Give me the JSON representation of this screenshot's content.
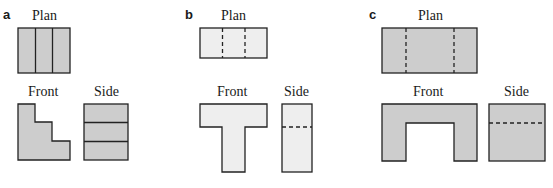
{
  "panels": [
    {
      "label": "a",
      "plan": "Plan",
      "front": "Front",
      "side": "Side",
      "fill": "#cdcdcd"
    },
    {
      "label": "b",
      "plan": "Plan",
      "front": "Front",
      "side": "Side",
      "fill": "#eeeeee"
    },
    {
      "label": "c",
      "plan": "Plan",
      "front": "Front",
      "side": "Side",
      "fill": "#cdcdcd"
    }
  ]
}
